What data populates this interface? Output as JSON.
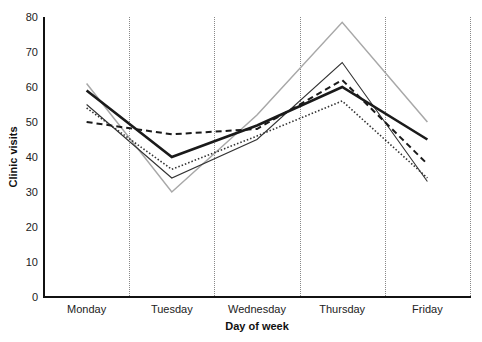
{
  "chart_data": {
    "type": "line",
    "title": "",
    "xlabel": "Day of week",
    "ylabel": "Clinic visits",
    "categories": [
      "Monday",
      "Tuesday",
      "Wednesday",
      "Thursday",
      "Friday"
    ],
    "ylim": [
      0,
      80
    ],
    "yticks": [
      0,
      10,
      20,
      30,
      40,
      50,
      60,
      70,
      80
    ],
    "grid": "vertical dotted separators between days",
    "legend": "none",
    "series": [
      {
        "name": "series-thick-solid",
        "style": "thick-solid",
        "color": "#1a1a1a",
        "values": [
          59,
          40,
          49,
          60,
          45
        ]
      },
      {
        "name": "series-dashed",
        "style": "dashed",
        "color": "#1a1a1a",
        "values": [
          50,
          46.5,
          48,
          62,
          38
        ]
      },
      {
        "name": "series-dotted",
        "style": "dotted",
        "color": "#333333",
        "values": [
          54,
          36.5,
          46,
          56,
          34
        ]
      },
      {
        "name": "series-thin-solid",
        "style": "thin-solid",
        "color": "#333333",
        "values": [
          55,
          34,
          45,
          67,
          33
        ]
      },
      {
        "name": "series-gray",
        "style": "gray-solid",
        "color": "#a8a8a8",
        "values": [
          61,
          30,
          52,
          78.5,
          50
        ]
      }
    ]
  }
}
